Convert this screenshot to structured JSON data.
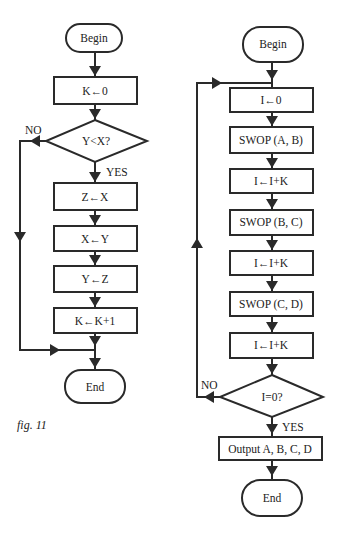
{
  "caption": "fig. 11",
  "left_flowchart": {
    "begin": "Begin",
    "init": "K←0",
    "decision": "Y<X?",
    "decision_no": "NO",
    "decision_yes": "YES",
    "steps": [
      "Z←X",
      "X←Y",
      "Y←Z",
      "K←K+1"
    ],
    "end": "End"
  },
  "right_flowchart": {
    "begin": "Begin",
    "steps": [
      "I←0",
      "SWOP (A, B)",
      "I←I+K",
      "SWOP (B, C)",
      "I←I+K",
      "SWOP (C, D)",
      "I←I+K"
    ],
    "decision": "I=0?",
    "decision_no": "NO",
    "decision_yes": "YES",
    "output": "Output A, B, C, D",
    "end": "End"
  }
}
